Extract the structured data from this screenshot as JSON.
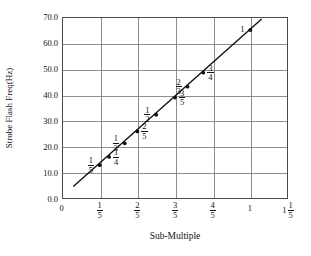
{
  "chart_data": {
    "type": "scatter",
    "title": "",
    "xlabel": "Sub-Multiple",
    "ylabel": "Strobe Flash Freq(Hz)",
    "xlim": [
      0,
      1.2
    ],
    "ylim": [
      0,
      70
    ],
    "grid": true,
    "legend": "none",
    "x_tick_labels": [
      "0",
      "1/5",
      "2/5",
      "3/5",
      "4/5",
      "1",
      "1 1/5"
    ],
    "x_tick_values": [
      0,
      0.2,
      0.4,
      0.6,
      0.8,
      1.0,
      1.2
    ],
    "y_tick_labels": [
      "0.0",
      "10.0",
      "20.0",
      "30.0",
      "40.0",
      "50.0",
      "60.0",
      "70.0"
    ],
    "y_tick_values": [
      0,
      10,
      20,
      30,
      40,
      50,
      60,
      70
    ],
    "points": [
      {
        "label": "1/5",
        "x": 0.2,
        "y": 13.0,
        "label_side": "left"
      },
      {
        "label": "1/4",
        "x": 0.25,
        "y": 16.2,
        "label_side": "right"
      },
      {
        "label": "1/3",
        "x": 0.3333,
        "y": 21.4,
        "label_side": "left"
      },
      {
        "label": "2/5",
        "x": 0.4,
        "y": 26.0,
        "label_side": "right"
      },
      {
        "label": "1/2",
        "x": 0.5,
        "y": 32.4,
        "label_side": "left"
      },
      {
        "label": "3/5",
        "x": 0.6,
        "y": 39.0,
        "label_side": "right"
      },
      {
        "label": "2/3",
        "x": 0.6667,
        "y": 43.2,
        "label_side": "left"
      },
      {
        "label": "3/4",
        "x": 0.75,
        "y": 48.6,
        "label_side": "right"
      },
      {
        "label": "1",
        "x": 1.0,
        "y": 65.0,
        "label_side": "left"
      }
    ],
    "trendline": {
      "x0": 0.06,
      "y0": 4.8,
      "x1": 1.06,
      "y1": 69.2
    }
  },
  "axes": {
    "y_title": "Strobe Flash Freq(Hz)",
    "x_title": "Sub-Multiple",
    "y_ticks": [
      {
        "text": "70.0",
        "value": 70
      },
      {
        "text": "60.0",
        "value": 60
      },
      {
        "text": "50.0",
        "value": 50
      },
      {
        "text": "40.0",
        "value": 40
      },
      {
        "text": "30.0",
        "value": 30
      },
      {
        "text": "20.0",
        "value": 20
      },
      {
        "text": "10.0",
        "value": 10
      },
      {
        "text": "0.0",
        "value": 0
      }
    ],
    "x_ticks": [
      {
        "whole": "0",
        "num": "",
        "den": "",
        "value": 0
      },
      {
        "whole": "",
        "num": "1",
        "den": "5",
        "value": 0.2
      },
      {
        "whole": "",
        "num": "2",
        "den": "5",
        "value": 0.4
      },
      {
        "whole": "",
        "num": "3",
        "den": "5",
        "value": 0.6
      },
      {
        "whole": "",
        "num": "4",
        "den": "5",
        "value": 0.8
      },
      {
        "whole": "1",
        "num": "",
        "den": "",
        "value": 1.0
      },
      {
        "whole": "1",
        "num": "1",
        "den": "5",
        "value": 1.2
      }
    ]
  },
  "point_labels": [
    {
      "num": "1",
      "den": "5"
    },
    {
      "num": "1",
      "den": "4"
    },
    {
      "num": "1",
      "den": "3"
    },
    {
      "num": "2",
      "den": "5"
    },
    {
      "num": "1",
      "den": "2"
    },
    {
      "num": "3",
      "den": "5"
    },
    {
      "num": "2",
      "den": "3"
    },
    {
      "num": "3",
      "den": "4"
    },
    {
      "whole": "1"
    }
  ],
  "colors": {
    "frame": "#4a4a4a",
    "grid": "#8d8d8d",
    "line": "#111111",
    "marker": "#111111",
    "text": "#111111",
    "background": "#ffffff"
  }
}
